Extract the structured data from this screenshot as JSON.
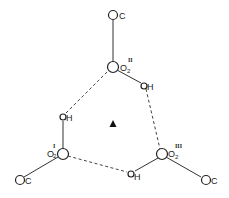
{
  "diagram": {
    "type": "hydrogen-bonded trimer (carboxyl oxygen ring)",
    "center_marker": {
      "symbol": "▲",
      "meaning": "threefold axis"
    },
    "atoms": {
      "c_top": {
        "label": "C"
      },
      "o_top": {
        "label": "O",
        "subscript": "2",
        "superscript": "II"
      },
      "h_top": {
        "label": "H"
      },
      "h_left": {
        "label": "H"
      },
      "o_left": {
        "label": "O",
        "subscript": "2",
        "superscript": "I"
      },
      "c_left": {
        "label": "C"
      },
      "o_right": {
        "label": "O",
        "subscript": "2",
        "superscript": "III"
      },
      "c_right": {
        "label": "C"
      },
      "h_bottom": {
        "label": "H"
      }
    },
    "bonds": [
      {
        "from": "C",
        "to": "O2(II)",
        "style": "solid"
      },
      {
        "from": "O2(II)",
        "to": "H",
        "style": "solid"
      },
      {
        "from": "O2(I)",
        "to": "H",
        "style": "solid"
      },
      {
        "from": "O2(I)",
        "to": "C",
        "style": "solid"
      },
      {
        "from": "O2(III)",
        "to": "C",
        "style": "solid"
      },
      {
        "from": "O2(III)",
        "to": "H",
        "style": "solid"
      }
    ],
    "hydrogen_bonds": [
      {
        "from": "H(left)",
        "to": "O2(II)",
        "style": "dashed"
      },
      {
        "from": "H(top)",
        "to": "O2(III)",
        "style": "dashed"
      },
      {
        "from": "H(bottom)",
        "to": "O2(I)",
        "style": "dashed"
      }
    ]
  }
}
